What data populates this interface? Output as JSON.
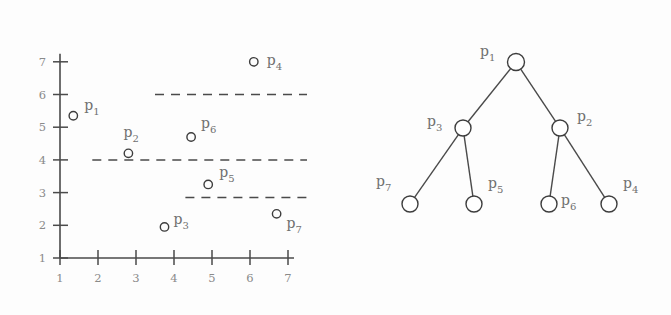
{
  "figure": {
    "background_color": "#fdfdfd",
    "stroke_color": "#4a4a4a",
    "label_color": "#707070"
  },
  "chart_data": [
    {
      "type": "scatter",
      "title": "",
      "xlabel": "",
      "ylabel": "",
      "xlim": [
        1,
        7
      ],
      "ylim": [
        1,
        7
      ],
      "grid": false,
      "legend": "none",
      "xticks": [
        1,
        2,
        3,
        4,
        5,
        6,
        7
      ],
      "yticks": [
        1,
        2,
        3,
        4,
        5,
        6,
        7
      ],
      "xticklabels": [
        "1",
        "2",
        "3",
        "4",
        "5",
        "6",
        "7"
      ],
      "yticklabels": [
        "1",
        "2",
        "3",
        "4",
        "5",
        "6",
        "7"
      ],
      "marker": "open-circle",
      "points": [
        {
          "id": "p1",
          "base": "p",
          "sub": "1",
          "x": 1.35,
          "y": 5.35,
          "label_dx": 11,
          "label_dy": -6
        },
        {
          "id": "p2",
          "base": "p",
          "sub": "2",
          "x": 2.8,
          "y": 4.2,
          "label_dx": -5,
          "label_dy": -16
        },
        {
          "id": "p3",
          "base": "p",
          "sub": "3",
          "x": 3.75,
          "y": 1.95,
          "label_dx": 9,
          "label_dy": -3
        },
        {
          "id": "p4",
          "base": "p",
          "sub": "4",
          "x": 6.1,
          "y": 7.0,
          "label_dx": 13,
          "label_dy": 3
        },
        {
          "id": "p5",
          "base": "p",
          "sub": "5",
          "x": 4.9,
          "y": 3.25,
          "label_dx": 11,
          "label_dy": -7
        },
        {
          "id": "p6",
          "base": "p",
          "sub": "6",
          "x": 4.45,
          "y": 4.7,
          "label_dx": 10,
          "label_dy": -9
        },
        {
          "id": "p7",
          "base": "p",
          "sub": "7",
          "x": 6.7,
          "y": 2.35,
          "label_dx": 10,
          "label_dy": 14
        }
      ],
      "split_lines": [
        {
          "name": "split-top",
          "y": 6.0,
          "x_start": 3.5,
          "x_end": 7.5
        },
        {
          "name": "split-middle",
          "y": 4.0,
          "x_start": 1.85,
          "x_end": 7.5
        },
        {
          "name": "split-bottom",
          "y": 2.85,
          "x_start": 4.3,
          "x_end": 7.5
        }
      ]
    },
    {
      "type": "diagram",
      "title": "",
      "layout": "binary-tree",
      "nodes": [
        {
          "id": "n-p1",
          "base": "p",
          "sub": "1",
          "cx": 176,
          "cy": 62,
          "r": 8.5,
          "label_dx": -36,
          "label_dy": -6
        },
        {
          "id": "n-p3",
          "base": "p",
          "sub": "3",
          "cx": 123,
          "cy": 128,
          "r": 8.0,
          "label_dx": -36,
          "label_dy": -2
        },
        {
          "id": "n-p2",
          "base": "p",
          "sub": "2",
          "cx": 220,
          "cy": 128,
          "r": 8.0,
          "label_dx": 17,
          "label_dy": -7
        },
        {
          "id": "n-p7",
          "base": "p",
          "sub": "7",
          "cx": 70,
          "cy": 204,
          "r": 8.0,
          "label_dx": -34,
          "label_dy": -18
        },
        {
          "id": "n-p5",
          "base": "p",
          "sub": "5",
          "cx": 134,
          "cy": 204,
          "r": 8.0,
          "label_dx": 14,
          "label_dy": -16
        },
        {
          "id": "n-p6",
          "base": "p",
          "sub": "6",
          "cx": 209,
          "cy": 204,
          "r": 8.0,
          "label_dx": 12,
          "label_dy": 1
        },
        {
          "id": "n-p4",
          "base": "p",
          "sub": "4",
          "cx": 269,
          "cy": 204,
          "r": 8.0,
          "label_dx": 14,
          "label_dy": -16
        }
      ],
      "edges": [
        {
          "from": "n-p1",
          "to": "n-p3"
        },
        {
          "from": "n-p1",
          "to": "n-p2"
        },
        {
          "from": "n-p3",
          "to": "n-p7"
        },
        {
          "from": "n-p3",
          "to": "n-p5"
        },
        {
          "from": "n-p2",
          "to": "n-p6"
        },
        {
          "from": "n-p2",
          "to": "n-p4"
        }
      ]
    }
  ]
}
